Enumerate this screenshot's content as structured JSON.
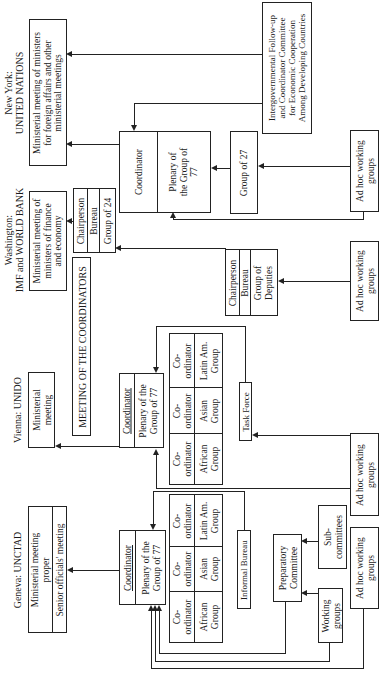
{
  "venues": {
    "new_york": {
      "heading_line1": "New York:",
      "heading_line2": "UNITED NATIONS",
      "ministerial": [
        "Ministerial meeting of ministers",
        "for foreign affairs and other",
        "ministerial meetings"
      ],
      "coordinator": "Coordinator",
      "plenary": [
        "Plenary of",
        "the Group of",
        "77"
      ],
      "group27": "Group of 27",
      "intergov": [
        "Intergovernmental Follow-up",
        "and Coordinator Committee",
        "for Economic Cooperation",
        "Among Developing Countries"
      ],
      "adhoc": [
        "Ad hoc working",
        "groups"
      ]
    },
    "washington": {
      "heading_line1": "Washington:",
      "heading_line2": "IMF and WORLD BANK",
      "ministerial": [
        "Ministerial meeting of",
        "ministers of finance",
        "and economy"
      ],
      "g24": [
        "Chairperson",
        "Bureau",
        "Group of 24"
      ],
      "deputies": [
        "Chairperson",
        "Bureau",
        "Group of",
        "Deputies"
      ],
      "adhoc": [
        "Ad hoc working",
        "groups"
      ]
    },
    "coordinators_meeting": "MEETING OF THE COORDINATORS",
    "vienna": {
      "heading": "Vienna: UNIDO",
      "ministerial": [
        "Ministerial",
        "meeting"
      ],
      "coordinator": "Coordinator",
      "plenary": [
        "Plenary of the",
        "Group of 77"
      ],
      "groups": [
        {
          "role": [
            "Co-",
            "ordinator"
          ],
          "name": [
            "African",
            "Group"
          ]
        },
        {
          "role": [
            "Co-",
            "ordinator"
          ],
          "name": [
            "Asian",
            "Group"
          ]
        },
        {
          "role": [
            "Co-",
            "ordinator"
          ],
          "name": [
            "Latin Am.",
            "Group"
          ]
        }
      ],
      "task_force": "Task Force",
      "adhoc": [
        "Ad hoc working",
        "groups"
      ]
    },
    "geneva": {
      "heading": "Geneva: UNCTAD",
      "ministerial": [
        "Ministerial meeting",
        "proper"
      ],
      "senior": "Senior officials' meeting",
      "coordinator": "Coordinator",
      "plenary": [
        "Plenary of the",
        "Group of 77"
      ],
      "groups": [
        {
          "role": [
            "Co-",
            "ordinator"
          ],
          "name": [
            "African",
            "Group"
          ]
        },
        {
          "role": [
            "Co-",
            "ordinator"
          ],
          "name": [
            "Asian",
            "Group"
          ]
        },
        {
          "role": [
            "Co-",
            "ordinator"
          ],
          "name": [
            "Latin Am.",
            "Group"
          ]
        }
      ],
      "informal_bureau": "Informal Bureau",
      "preparatory": [
        "Preparatory",
        "Committee"
      ],
      "subcommittees": [
        "Sub-",
        "committees"
      ],
      "working_groups": [
        "Working",
        "groups"
      ],
      "adhoc": [
        "Ad hoc working",
        "groups"
      ]
    }
  },
  "colors": {
    "line": "#222222",
    "background": "#ffffff"
  }
}
